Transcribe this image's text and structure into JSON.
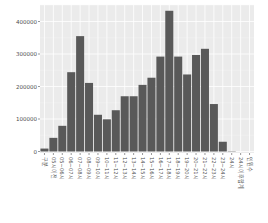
{
  "chart_data": {
    "type": "bar",
    "title": "",
    "xlabel": "",
    "ylabel": "",
    "ylim": [
      0,
      450000
    ],
    "yticks": [
      0,
      100000,
      200000,
      300000,
      400000
    ],
    "ytick_labels": [
      "0",
      "100000",
      "200000",
      "300000",
      "400000"
    ],
    "grid": true,
    "legend": null,
    "bar_color": "#595959",
    "panel_color": "#ebebeb",
    "grid_color": "#ffffff",
    "categories": [
      "구분",
      "05시이전",
      "05~06시",
      "06~07시",
      "07~08시",
      "08~09시",
      "09~10시",
      "10~11시",
      "11~12시",
      "12~13시",
      "13~14시",
      "14~15시",
      "15~16시",
      "16~17시",
      "17~18시",
      "18~19시",
      "19~20시",
      "20~21시",
      "21~22시",
      "22~23시",
      "23~24시",
      "24시",
      "24시이후합계",
      "인원수"
    ],
    "values": [
      9000,
      42000,
      79000,
      244000,
      355000,
      211000,
      113000,
      99000,
      127000,
      170000,
      170000,
      205000,
      227000,
      292000,
      433000,
      292000,
      237000,
      297000,
      316000,
      146000,
      30000,
      1000,
      0,
      0
    ]
  }
}
